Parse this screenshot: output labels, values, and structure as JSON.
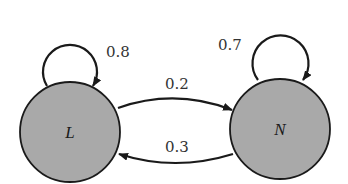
{
  "diagram": {
    "type": "state-transition",
    "colors": {
      "state_fill": "#a9a9a9",
      "stroke": "#1a1a1a",
      "background": "#ffffff"
    },
    "states": [
      {
        "id": "L",
        "label": "L"
      },
      {
        "id": "N",
        "label": "N"
      }
    ],
    "transitions": [
      {
        "from": "L",
        "to": "L",
        "label": "0.8"
      },
      {
        "from": "N",
        "to": "N",
        "label": "0.7"
      },
      {
        "from": "L",
        "to": "N",
        "label": "0.2"
      },
      {
        "from": "N",
        "to": "L",
        "label": "0.3"
      }
    ]
  }
}
